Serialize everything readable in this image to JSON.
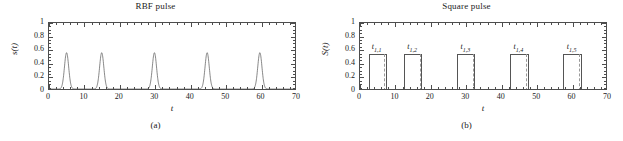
{
  "figure": {
    "panels": [
      {
        "id": "a",
        "title": "RBF pulse",
        "subcaption": "(a)",
        "xlabel": "t",
        "ylabel": "s(t)"
      },
      {
        "id": "b",
        "title": "Square pulse",
        "subcaption": "(b)",
        "xlabel": "t",
        "ylabel": "S(t)"
      }
    ],
    "xticks": [
      "0",
      "10",
      "20",
      "30",
      "40",
      "50",
      "60",
      "70"
    ],
    "yticks": [
      "0",
      "0.2",
      "0.4",
      "0.6",
      "0.8",
      "1"
    ],
    "pulse_labels": [
      {
        "base": "t",
        "sub": "1,1"
      },
      {
        "base": "t",
        "sub": "1,2"
      },
      {
        "base": "t",
        "sub": "1,3"
      },
      {
        "base": "t",
        "sub": "1,4"
      },
      {
        "base": "t",
        "sub": "1,5"
      }
    ],
    "colors": {
      "axis": "#4d4d4d",
      "curve": "#555555",
      "dashed": "#9a9a9a",
      "text": "#1a1a1a",
      "background": "#ffffff"
    }
  },
  "chart_data": [
    {
      "type": "line",
      "title": "RBF pulse",
      "xlabel": "t",
      "ylabel": "s(t)",
      "xlim": [
        0,
        70
      ],
      "ylim": [
        0,
        1
      ],
      "xtick_values": [
        0,
        10,
        20,
        30,
        40,
        50,
        60,
        70
      ],
      "ytick_values": [
        0,
        0.2,
        0.4,
        0.6,
        0.8,
        1
      ],
      "xtick_labels": [
        "0",
        "10",
        "20",
        "30",
        "40",
        "50",
        "60",
        "70"
      ],
      "ytick_labels": [
        "0",
        "0.2",
        "0.4",
        "0.6",
        "0.8",
        "1"
      ],
      "grid": false,
      "legend": "none",
      "series": [
        {
          "name": "s(t)",
          "description": "Five narrow Gaussian radial-basis-function pulses on a zero baseline",
          "peak_centers": [
            5,
            15,
            30,
            45,
            60
          ],
          "peak_amplitudes": [
            0.55,
            0.55,
            0.55,
            0.55,
            0.55
          ],
          "peak_halfwidth": 0.85,
          "baseline": 0
        }
      ]
    },
    {
      "type": "bar",
      "title": "Square pulse",
      "xlabel": "t",
      "ylabel": "S(t)",
      "xlim": [
        0,
        70
      ],
      "ylim": [
        0,
        1
      ],
      "xtick_values": [
        0,
        10,
        20,
        30,
        40,
        50,
        60,
        70
      ],
      "ytick_values": [
        0,
        0.2,
        0.4,
        0.6,
        0.8,
        1
      ],
      "xtick_labels": [
        "0",
        "10",
        "20",
        "30",
        "40",
        "50",
        "60",
        "70"
      ],
      "ytick_labels": [
        "0",
        "0.2",
        "0.4",
        "0.6",
        "0.8",
        "1"
      ],
      "grid": false,
      "legend": "none",
      "series": [
        {
          "name": "S(t)",
          "description": "Five rectangular pulses of equal height with a dashed marker line inside the right portion of each pulse",
          "pulses": [
            {
              "label": "t1,1",
              "start": 2.4,
              "end": 7.6,
              "height": 0.55,
              "dashed_at": 6.9,
              "label_x": 5.0
            },
            {
              "label": "t1,2",
              "start": 12.4,
              "end": 17.6,
              "height": 0.55,
              "dashed_at": 16.9,
              "label_x": 15.0
            },
            {
              "label": "t1,3",
              "start": 27.4,
              "end": 32.6,
              "height": 0.55,
              "dashed_at": 31.9,
              "label_x": 30.0
            },
            {
              "label": "t1,4",
              "start": 42.4,
              "end": 47.6,
              "height": 0.55,
              "dashed_at": 46.9,
              "label_x": 45.0
            },
            {
              "label": "t1,5",
              "start": 57.4,
              "end": 62.6,
              "height": 0.55,
              "dashed_at": 61.9,
              "label_x": 60.0
            }
          ],
          "baseline": 0
        }
      ]
    }
  ]
}
